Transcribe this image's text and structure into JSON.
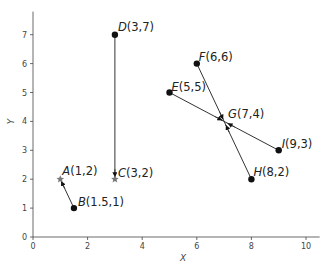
{
  "chart_data": {
    "type": "scatter",
    "title": "",
    "xlabel": "X",
    "ylabel": "Y",
    "xlim": [
      0,
      10.5
    ],
    "ylim": [
      0,
      7.8
    ],
    "grid": false,
    "x_ticks": [
      "0",
      "2",
      "4",
      "6",
      "8",
      "10"
    ],
    "y_ticks": [
      "0",
      "1",
      "2",
      "3",
      "4",
      "5",
      "6",
      "7"
    ],
    "points": [
      {
        "name": "A",
        "x": 1,
        "y": 2,
        "label": "A(1,2)",
        "marker": "star"
      },
      {
        "name": "B",
        "x": 1.5,
        "y": 1,
        "label": "B(1.5,1)",
        "marker": "dot"
      },
      {
        "name": "C",
        "x": 3,
        "y": 2,
        "label": "C(3,2)",
        "marker": "star"
      },
      {
        "name": "D",
        "x": 3,
        "y": 7,
        "label": "D(3,7)",
        "marker": "dot"
      },
      {
        "name": "E",
        "x": 5,
        "y": 5,
        "label": "E(5,5)",
        "marker": "dot"
      },
      {
        "name": "F",
        "x": 6,
        "y": 6,
        "label": "F(6,6)",
        "marker": "dot"
      },
      {
        "name": "G",
        "x": 7,
        "y": 4,
        "label": "G(7,4)",
        "marker": "none"
      },
      {
        "name": "H",
        "x": 8,
        "y": 2,
        "label": "H(8,2)",
        "marker": "dot"
      },
      {
        "name": "I",
        "x": 9,
        "y": 3,
        "label": "I(9,3)",
        "marker": "dot"
      }
    ],
    "segments": [
      {
        "from": "B",
        "to": "A",
        "arrow_at": "A"
      },
      {
        "from": "D",
        "to": "C",
        "arrow_at": "C"
      },
      {
        "from": "E",
        "to": "I",
        "arrow_at": "G"
      },
      {
        "from": "F",
        "to": "H",
        "arrow_at": "G"
      }
    ]
  },
  "colors": {
    "axis": "#444444",
    "line": "#333333",
    "marker": "#111111",
    "star": "#777777"
  }
}
